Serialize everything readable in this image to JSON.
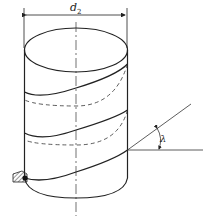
{
  "figure": {
    "type": "helix-on-cylinder",
    "colors": {
      "stroke": "#222222",
      "background": "#ffffff"
    }
  },
  "labels": {
    "diameter": {
      "symbol": "d",
      "subscript": "2"
    },
    "angle": "λ"
  },
  "elements": {
    "cylinder": "cylinder",
    "helix": "helical-line",
    "dimension": "diameter-dimension",
    "angle_marker": "lead-angle",
    "tool": "cutting-tool"
  }
}
